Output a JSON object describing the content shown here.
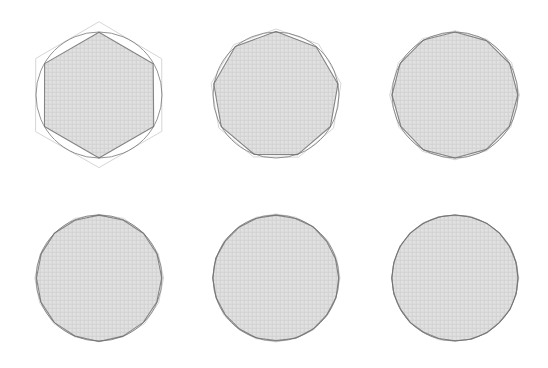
{
  "figure": {
    "background_color": "#ffffff",
    "width": 548,
    "height": 368,
    "rows": 2,
    "columns": 3
  },
  "style": {
    "fill_color": "#d9d9d9",
    "fill_opacity": "0.95",
    "inscribed_stroke_color": "#6e6e6e",
    "inscribed_stroke_width": "1.1",
    "circumscribed_stroke_color": "#d5d5d5",
    "circumscribed_stroke_width": "1.0",
    "circle_stroke_color": "#6a6a6a",
    "circle_stroke_width": "1.0",
    "texture_color": "#c6c6c6",
    "texture_spacing": "4"
  },
  "chart_data": {
    "type": "diagram",
    "subtitle": "Inscribed and circumscribed regular polygons converging to a circle",
    "xlabel": "",
    "ylabel": "",
    "grid": false,
    "legend": "none",
    "panels": [
      {
        "index": 1,
        "label": "",
        "sides": 6,
        "rotation_deg": -90,
        "center_x": 99,
        "center_y": 95,
        "circle_radius": 63,
        "inscribed_radius": 63,
        "circumscribed_radius": 72.7,
        "show_circumscribed": true,
        "show_circle": true
      },
      {
        "index": 2,
        "label": "",
        "sides": 9,
        "rotation_deg": -90,
        "center_x": 276,
        "center_y": 95,
        "circle_radius": 63,
        "inscribed_radius": 63,
        "circumscribed_radius": 66.3,
        "show_circumscribed": true,
        "show_circle": true
      },
      {
        "index": 3,
        "label": "",
        "sides": 12,
        "rotation_deg": -90,
        "center_x": 455,
        "center_y": 95,
        "circle_radius": 63,
        "inscribed_radius": 63,
        "circumscribed_radius": 64.8,
        "show_circumscribed": true,
        "show_circle": true
      },
      {
        "index": 4,
        "label": "",
        "sides": 16,
        "rotation_deg": -90,
        "center_x": 99,
        "center_y": 278,
        "circle_radius": 63,
        "inscribed_radius": 63,
        "circumscribed_radius": 64.0,
        "show_circumscribed": true,
        "show_circle": true
      },
      {
        "index": 5,
        "label": "",
        "sides": 20,
        "rotation_deg": -90,
        "center_x": 276,
        "center_y": 278,
        "circle_radius": 63,
        "inscribed_radius": 63,
        "circumscribed_radius": 63.6,
        "show_circumscribed": true,
        "show_circle": true
      },
      {
        "index": 6,
        "label": "",
        "sides": 24,
        "rotation_deg": -90,
        "center_x": 455,
        "center_y": 278,
        "circle_radius": 63,
        "inscribed_radius": 63,
        "circumscribed_radius": 63.4,
        "show_circumscribed": true,
        "show_circle": true
      }
    ]
  }
}
